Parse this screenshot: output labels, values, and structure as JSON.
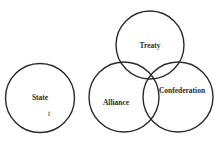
{
  "diagram": {
    "type": "venn",
    "stroke_color": "#2b2b2b",
    "background": "#ffffff",
    "circles": [
      {
        "id": "state",
        "label": "State",
        "cx": 40,
        "cy": 98,
        "r": 34.5,
        "label_x": 40,
        "label_y": 100
      },
      {
        "id": "treaty",
        "label": "Treaty",
        "cx": 150,
        "cy": 45,
        "r": 34,
        "label_x": 150,
        "label_y": 48
      },
      {
        "id": "alliance",
        "label": "Alliance",
        "cx": 124,
        "cy": 97,
        "r": 35,
        "label_x": 116,
        "label_y": 105
      },
      {
        "id": "confederation",
        "label": "Confederation",
        "cx": 178,
        "cy": 97,
        "r": 35,
        "label_x": 182,
        "label_y": 93
      }
    ],
    "annotations": [
      {
        "text": "t",
        "x": 49,
        "y": 116,
        "style": "italic"
      }
    ]
  }
}
